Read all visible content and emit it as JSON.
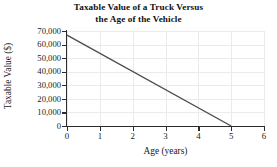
{
  "chart_data": {
    "type": "line",
    "title": "Taxable Value of a Truck Versus the Age of the Vehicle",
    "title_lines": [
      "Taxable Value of a Truck Versus",
      "the Age of the Vehicle"
    ],
    "xlabel": "Age (years)",
    "ylabel": "Taxable Value ($)",
    "xlim": [
      0,
      6
    ],
    "ylim": [
      0,
      70000
    ],
    "grid": true,
    "legend": false,
    "xticks": [
      0,
      1,
      2,
      3,
      4,
      5,
      6
    ],
    "xtick_labels": [
      "0",
      "1",
      "2",
      "3",
      "4",
      "5",
      "6"
    ],
    "yticks": [
      0,
      10000,
      20000,
      30000,
      40000,
      50000,
      60000,
      70000
    ],
    "ytick_labels": [
      "0",
      "10,000",
      "20,000",
      "30,000",
      "40,000",
      "50,000",
      "60,000",
      "70,000"
    ],
    "series": [
      {
        "name": "Taxable Value",
        "color": "#4d4d4d",
        "x": [
          0,
          5
        ],
        "values": [
          67000,
          0
        ]
      }
    ],
    "line_color": "#4d4d4d",
    "grid_color": "#ebebeb",
    "axis_color": "#2b2b2b",
    "background_color": "#ffffff"
  }
}
